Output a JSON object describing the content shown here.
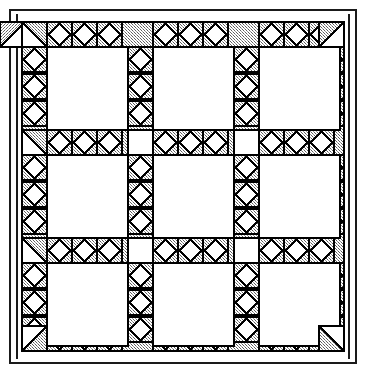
{
  "figure": {
    "canvas": {
      "width": 366,
      "height": 373
    }
  },
  "colors": {
    "background": "#ffffff",
    "ink": "#1a1a1a",
    "line": "#000000",
    "hatch_fill": "#b9b9b9",
    "hatch_dot": "#6e6e6e",
    "block_fill": "#ffffff"
  },
  "frame": {
    "outer": {
      "x": 9,
      "y": 9,
      "width": 347,
      "height": 354,
      "stroke_width": 2,
      "label": "outer-frame"
    },
    "inner_rule": {
      "x": 16,
      "y": 14,
      "width": 2,
      "height": 345,
      "label": "inner-rule-left"
    },
    "gap_label": "white margin"
  },
  "lattice": {
    "x": 22,
    "y": 22,
    "width": 322,
    "height": 329,
    "band": 25,
    "bands_vertical": 4,
    "bands_horizontal": 4,
    "motif": "diamond-cross",
    "label": "lattice-sashing"
  },
  "grid": {
    "rows": 3,
    "cols": 3,
    "cell_count": 9,
    "cell_label": "plain-block",
    "cells": [
      {
        "row": 1,
        "col": 1,
        "x": 47,
        "y": 47,
        "width": 81,
        "height": 83
      },
      {
        "row": 1,
        "col": 2,
        "x": 153,
        "y": 47,
        "width": 81,
        "height": 83
      },
      {
        "row": 1,
        "col": 3,
        "x": 259,
        "y": 47,
        "width": 81,
        "height": 83
      },
      {
        "row": 2,
        "col": 1,
        "x": 47,
        "y": 155,
        "width": 81,
        "height": 83
      },
      {
        "row": 2,
        "col": 2,
        "x": 153,
        "y": 155,
        "width": 81,
        "height": 83
      },
      {
        "row": 2,
        "col": 3,
        "x": 259,
        "y": 155,
        "width": 81,
        "height": 83
      },
      {
        "row": 3,
        "col": 1,
        "x": 47,
        "y": 263,
        "width": 81,
        "height": 83
      },
      {
        "row": 3,
        "col": 2,
        "x": 153,
        "y": 263,
        "width": 81,
        "height": 83
      },
      {
        "row": 3,
        "col": 3,
        "x": 259,
        "y": 263,
        "width": 81,
        "height": 83
      }
    ]
  },
  "intersections": {
    "label": "sashing-intersection-square",
    "fill": "#ffffff",
    "size": 25,
    "count": 16
  },
  "corners": {
    "label": "corner-block",
    "motif": "half-square-triangle",
    "count": 4
  }
}
